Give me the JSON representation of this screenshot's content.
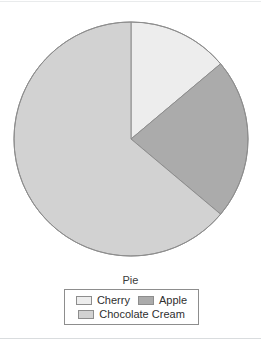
{
  "chart_data": {
    "type": "pie",
    "title": "Pie",
    "xlabel": "",
    "ylabel": "",
    "legend_position": "bottom",
    "grid": false,
    "start_angle_deg": 0,
    "direction": "clockwise",
    "categories": [
      "Cherry",
      "Apple",
      "Chocolate Cream"
    ],
    "values": [
      14,
      22,
      64
    ],
    "units": "percent",
    "slices": [
      {
        "label": "Cherry",
        "value": 14,
        "percent": 14,
        "color": "#ededed",
        "start_angle_deg": 0,
        "end_angle_deg": 50
      },
      {
        "label": "Apple",
        "value": 22,
        "percent": 22,
        "color": "#ababab",
        "start_angle_deg": 50,
        "end_angle_deg": 130
      },
      {
        "label": "Chocolate Cream",
        "value": 64,
        "percent": 64,
        "color": "#d2d2d2",
        "start_angle_deg": 130,
        "end_angle_deg": 360
      }
    ]
  },
  "chart": {
    "title": "Pie",
    "center_x": 131,
    "center_y": 139,
    "radius": 117,
    "outline_color": "#8d8d8d",
    "background": "#ffffff"
  },
  "legend": {
    "items": [
      {
        "label": "Cherry",
        "color": "#ededed"
      },
      {
        "label": "Apple",
        "color": "#ababab"
      },
      {
        "label": "Chocolate Cream",
        "color": "#d2d2d2"
      }
    ],
    "border_color": "#8d8d8d"
  }
}
